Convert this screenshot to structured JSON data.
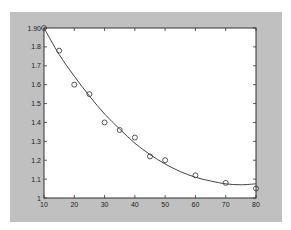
{
  "chart_data": {
    "type": "scatter",
    "title": "",
    "xlabel": "",
    "ylabel": "",
    "xlim": [
      10,
      80
    ],
    "ylim": [
      1.0,
      1.9
    ],
    "grid": false,
    "legend": null,
    "x_ticks": [
      "10",
      "20",
      "30",
      "40",
      "50",
      "60",
      "70",
      "80"
    ],
    "y_ticks": [
      "1",
      "1.1",
      "1.2",
      "1.3",
      "1.4",
      "1.5",
      "1.6",
      "1.7",
      "1.8",
      "1.90"
    ],
    "series": [
      {
        "name": "measured",
        "type": "scatter",
        "marker": "circle",
        "x": [
          10,
          15,
          20,
          25,
          30,
          35,
          40,
          45,
          50,
          60,
          70,
          80
        ],
        "y": [
          1.9,
          1.78,
          1.6,
          1.55,
          1.4,
          1.36,
          1.32,
          1.22,
          1.2,
          1.12,
          1.08,
          1.05
        ]
      },
      {
        "name": "fit",
        "type": "line",
        "x": [
          10,
          15,
          20,
          25,
          30,
          35,
          40,
          45,
          50,
          55,
          60,
          65,
          70,
          75,
          80
        ],
        "y": [
          1.9,
          1.76,
          1.645,
          1.54,
          1.445,
          1.365,
          1.29,
          1.23,
          1.18,
          1.14,
          1.11,
          1.09,
          1.075,
          1.07,
          1.075
        ]
      }
    ],
    "colors": {
      "figure_bg": "#c0c0c0",
      "axes_bg": "#ffffff",
      "line": "#444444",
      "marker": "#444444"
    }
  }
}
